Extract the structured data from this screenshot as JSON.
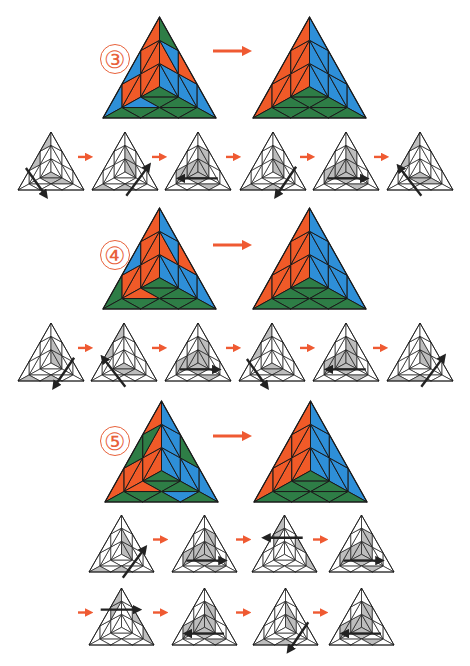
{
  "colors": {
    "orange": "#f05a28",
    "blue": "#2e8fd8",
    "green": "#2e7d46",
    "arrow_red": "#ef5a32",
    "gray_fill": "#bdbdbd",
    "dark_gray_fill": "#a6a6a6",
    "stroke": "#1a1a1a",
    "move_arrow": "#222222"
  },
  "steps": [
    {
      "label": "③",
      "label_pos": [
        100,
        44
      ],
      "before": {
        "x": 103,
        "y": 17,
        "w": 113,
        "h": 101,
        "state": "step3_before"
      },
      "after": {
        "x": 253,
        "y": 17,
        "w": 113,
        "h": 101,
        "state": "solved"
      },
      "big_arrow": {
        "x1": 213,
        "y1": 51,
        "x2": 254,
        "y2": 51
      },
      "move_rows": [
        {
          "y": 132,
          "h": 58,
          "w": 66,
          "xs": [
            18,
            92,
            165,
            240,
            313,
            387
          ],
          "arrow_xs": [
            78,
            152,
            226,
            300,
            374
          ],
          "moves": [
            {
              "shade": "left_corner",
              "arrow": "down-right-left"
            },
            {
              "shade": "right_corner",
              "arrow": "up-right-right"
            },
            {
              "shade": "center",
              "arrow": "left-bottom"
            },
            {
              "shade": "right_corner",
              "arrow": "down-left-right"
            },
            {
              "shade": "center",
              "arrow": "right-bottom"
            },
            {
              "shade": "left_corner",
              "arrow": "up-left-left"
            }
          ]
        }
      ]
    },
    {
      "label": "④",
      "label_pos": [
        100,
        240
      ],
      "before": {
        "x": 103,
        "y": 208,
        "w": 113,
        "h": 101,
        "state": "step4_before"
      },
      "after": {
        "x": 253,
        "y": 208,
        "w": 113,
        "h": 101,
        "state": "solved"
      },
      "big_arrow": {
        "x1": 213,
        "y1": 245,
        "x2": 254,
        "y2": 245
      },
      "move_rows": [
        {
          "y": 323,
          "h": 58,
          "w": 66,
          "xs": [
            18,
            91,
            165,
            239,
            313,
            387
          ],
          "arrow_xs": [
            78,
            152,
            226,
            300,
            373
          ],
          "moves": [
            {
              "shade": "right_corner",
              "arrow": "down-left-right"
            },
            {
              "shade": "left_corner",
              "arrow": "up-left-left"
            },
            {
              "shade": "center",
              "arrow": "right-bottom"
            },
            {
              "shade": "left_corner",
              "arrow": "down-right-left"
            },
            {
              "shade": "center",
              "arrow": "left-bottom"
            },
            {
              "shade": "right_corner",
              "arrow": "up-right-right"
            }
          ]
        }
      ]
    },
    {
      "label": "⑤",
      "label_pos": [
        100,
        426
      ],
      "before": {
        "x": 105,
        "y": 401,
        "w": 113,
        "h": 101,
        "state": "step5_before"
      },
      "after": {
        "x": 254,
        "y": 401,
        "w": 113,
        "h": 101,
        "state": "solved"
      },
      "big_arrow": {
        "x1": 213,
        "y1": 436,
        "x2": 254,
        "y2": 436
      },
      "move_rows": [
        {
          "y": 515,
          "h": 57,
          "w": 65,
          "xs": [
            89,
            172,
            252,
            329
          ],
          "arrow_xs": [
            153,
            236,
            313
          ],
          "leading_arrow": false,
          "moves": [
            {
              "shade": "right_corner",
              "arrow": "up-right-right"
            },
            {
              "shade": "center",
              "arrow": "right-bottom"
            },
            {
              "shade": "top_corner",
              "arrow": "left-top"
            },
            {
              "shade": "center",
              "arrow": "right-bottom"
            }
          ]
        },
        {
          "y": 588,
          "h": 57,
          "w": 65,
          "xs": [
            89,
            172,
            253,
            329
          ],
          "arrow_xs": [
            78,
            153,
            236,
            313
          ],
          "leading_arrow": true,
          "moves": [
            {
              "shade": "top_corner",
              "arrow": "right-top"
            },
            {
              "shade": "center",
              "arrow": "left-bottom"
            },
            {
              "shade": "right_corner",
              "arrow": "down-left-right"
            },
            {
              "shade": "center",
              "arrow": "left-bottom"
            }
          ]
        }
      ]
    }
  ]
}
